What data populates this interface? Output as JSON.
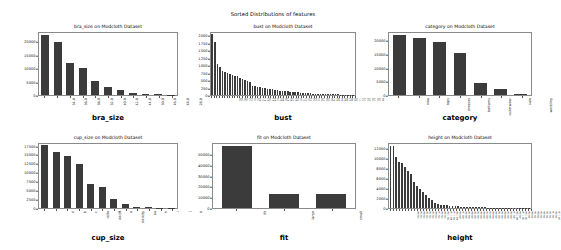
{
  "figure": {
    "suptitle": "Sorted Distributions of features",
    "dataset": "Modcloth Dataset",
    "bar_color": "#3b3b3b",
    "axes_color": "#8a8a8a",
    "background": "#ffffff"
  },
  "chart_data": [
    {
      "type": "bar",
      "id": "bra_size",
      "title": "bra_size on Modcloth Dataset",
      "xlabel": "bra_size",
      "ylabel": "",
      "grid": false,
      "legend": null,
      "ylim": [
        0,
        23500
      ],
      "yticks": [
        0,
        5000,
        10000,
        15000,
        20000
      ],
      "ytick_labels": [
        "0",
        "5000",
        "10000",
        "15000",
        "20000"
      ],
      "categories": [
        "34.0",
        "36.0",
        "38.0",
        "32.0",
        "40.0",
        "42.0",
        "44.0",
        "30.0",
        "46.0",
        "48.0",
        "28.0"
      ],
      "values": [
        22400,
        19600,
        11800,
        10000,
        5100,
        3100,
        1800,
        800,
        330,
        210,
        120
      ]
    },
    {
      "type": "bar",
      "id": "bust",
      "title": "bust on Modcloth Dataset",
      "xlabel": "bust",
      "ylabel": "",
      "grid": false,
      "legend": null,
      "ylim": [
        0,
        2100
      ],
      "yticks": [
        0,
        250,
        500,
        750,
        1000,
        1250,
        1500,
        1750,
        2000
      ],
      "ytick_labels": [
        "0",
        "250",
        "500",
        "750",
        "1000",
        "1250",
        "1500",
        "1750",
        "2000"
      ],
      "categories": [
        "36",
        "34",
        "38",
        "35",
        "37",
        "33",
        "39",
        "32",
        "40",
        "31",
        "41",
        "42",
        "30",
        "43",
        "44",
        "29",
        "45",
        "46",
        "28",
        "47",
        "48",
        "27",
        "49",
        "50",
        "26",
        "51",
        "52",
        "25",
        "53",
        "54",
        "24",
        "55",
        "56",
        "57",
        "58",
        "59",
        "60",
        "61",
        "62",
        "63",
        "64",
        "65",
        "66",
        "67",
        "68",
        "69",
        "70",
        "71",
        "72",
        "73",
        "74",
        "75",
        "76",
        "77",
        "78",
        "79",
        "80"
      ],
      "values": [
        2050,
        1780,
        1050,
        930,
        800,
        760,
        740,
        700,
        680,
        640,
        620,
        560,
        520,
        490,
        470,
        440,
        300,
        290,
        270,
        255,
        240,
        225,
        210,
        200,
        190,
        175,
        160,
        150,
        140,
        130,
        120,
        110,
        100,
        92,
        85,
        78,
        70,
        64,
        58,
        52,
        48,
        44,
        40,
        36,
        33,
        30,
        27,
        24,
        22,
        20,
        18,
        16,
        14,
        12,
        10,
        8,
        6
      ]
    },
    {
      "type": "bar",
      "id": "category",
      "title": "category on Modcloth Dataset",
      "xlabel": "category",
      "ylabel": "",
      "grid": false,
      "legend": null,
      "ylim": [
        0,
        23000
      ],
      "yticks": [
        0,
        5000,
        10000,
        15000,
        20000
      ],
      "ytick_labels": [
        "0",
        "5000",
        "10000",
        "15000",
        "20000"
      ],
      "categories": [
        "new",
        "tops",
        "dresses",
        "bottoms",
        "outerwear",
        "sale",
        "wedding"
      ],
      "values": [
        21800,
        20900,
        19300,
        15400,
        4300,
        2300,
        250
      ]
    },
    {
      "type": "bar",
      "id": "cup_size",
      "title": "cup_size on Modcloth Dataset",
      "xlabel": "cup_size",
      "ylabel": "",
      "grid": false,
      "legend": null,
      "ylim": [
        0,
        18200
      ],
      "yticks": [
        0,
        2500,
        5000,
        7500,
        10000,
        12500,
        15000,
        17500
      ],
      "ytick_labels": [
        "0",
        "2500",
        "5000",
        "7500",
        "10000",
        "12500",
        "15000",
        "17500"
      ],
      "categories": [
        "d",
        "b",
        "c",
        "dd/e",
        "ddd/f",
        "a",
        "dddd/g",
        "aa",
        "h",
        "i",
        "j",
        "k"
      ],
      "values": [
        17700,
        15600,
        14700,
        12400,
        6700,
        5800,
        2400,
        1100,
        350,
        160,
        90,
        50
      ]
    },
    {
      "type": "bar",
      "id": "fit",
      "title": "fit on Modcloth Dataset",
      "xlabel": "fit",
      "ylabel": "",
      "grid": false,
      "legend": null,
      "ylim": [
        0,
        60000
      ],
      "yticks": [
        0,
        10000,
        20000,
        30000,
        40000,
        50000
      ],
      "ytick_labels": [
        "0",
        "10000",
        "20000",
        "30000",
        "40000",
        "50000"
      ],
      "categories": [
        "fit",
        "large",
        "small"
      ],
      "values": [
        57000,
        13300,
        13300
      ]
    },
    {
      "type": "bar",
      "id": "height",
      "title": "height on Modcloth Dataset",
      "xlabel": "height",
      "ylabel": "",
      "grid": false,
      "legend": null,
      "ylim": [
        0,
        13000
      ],
      "yticks": [
        0,
        2000,
        4000,
        6000,
        8000,
        10000,
        12000
      ],
      "ytick_labels": [
        "0",
        "2000",
        "4000",
        "6000",
        "8000",
        "10000",
        "12000"
      ],
      "categories": [
        "5ft 4in",
        "5ft 5in",
        "5ft 6in",
        "5ft 3in",
        "5ft 7in",
        "5ft 2in",
        "5ft 8in",
        "5ft 1in",
        "5ft 9in",
        "5ft 0in",
        "5ft 10in",
        "4ft 11in",
        "5ft 11in",
        "4ft 10in",
        "6ft 0in",
        "6ft 1in",
        "4ft 9in",
        "6ft 2in",
        "4ft 8in",
        "6ft 3in",
        "4ft 7in",
        "6ft 4in",
        "4ft 6in",
        "6ft 5in",
        "4ft 5in",
        "6ft 6in",
        "4ft 4in",
        "6ft 7in",
        "4ft 3in",
        "6ft 8in",
        "4ft 2in",
        "6ft 9in",
        "4ft 1in",
        "6ft 10in",
        "4ft 0in",
        "3ft 11in",
        "3ft 10in",
        "3ft 9in",
        "3ft 8in",
        "3ft 7in",
        "3ft 6in",
        "3ft 5in",
        "3ft 4in",
        "3ft 3in",
        "3ft 2in",
        "3ft 1in",
        "3ft 0in",
        "2ft 11in"
      ],
      "values": [
        12500,
        12400,
        10200,
        9300,
        9000,
        8300,
        7500,
        6900,
        5300,
        4400,
        3800,
        3200,
        2700,
        2100,
        1700,
        1000,
        800,
        700,
        620,
        560,
        500,
        440,
        390,
        340,
        300,
        260,
        230,
        200,
        175,
        155,
        135,
        120,
        105,
        92,
        80,
        70,
        62,
        54,
        48,
        42,
        36,
        32,
        28,
        24,
        20,
        17,
        14,
        11
      ]
    }
  ]
}
